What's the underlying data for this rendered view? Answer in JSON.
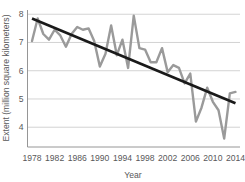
{
  "chart_data": {
    "type": "line",
    "title": "",
    "xlabel": "Year",
    "ylabel": "Extent (million square kilometers)",
    "xlim": [
      1977.2,
      2014.8
    ],
    "ylim": [
      3.3,
      8.15
    ],
    "xticks": [
      1978,
      1982,
      1986,
      1990,
      1994,
      1998,
      2002,
      2006,
      2010,
      2014
    ],
    "yticks": [
      4,
      5,
      6,
      7,
      8
    ],
    "grid": "horizontal",
    "legend": "none",
    "colors": {
      "data_line": "#9a9a9a",
      "trend_line": "#1a1a1a",
      "grid": "#c8c8c8",
      "axis": "#8a8a8a",
      "text": "#58585a",
      "background": "#ffffff"
    },
    "series": [
      {
        "name": "Sea ice extent",
        "color": "#9a9a9a",
        "x": [
          1978,
          1979,
          1980,
          1981,
          1982,
          1983,
          1984,
          1985,
          1986,
          1987,
          1988,
          1989,
          1990,
          1991,
          1992,
          1993,
          1994,
          1995,
          1996,
          1997,
          1998,
          1999,
          2000,
          2001,
          2002,
          2003,
          2004,
          2005,
          2006,
          2007,
          2008,
          2009,
          2010,
          2011,
          2012,
          2013,
          2014
        ],
        "values": [
          7.05,
          7.85,
          7.3,
          7.1,
          7.45,
          7.25,
          6.85,
          7.3,
          7.55,
          7.45,
          7.5,
          7.05,
          6.15,
          6.6,
          7.6,
          6.55,
          7.1,
          6.1,
          7.95,
          6.8,
          6.75,
          6.3,
          6.3,
          6.8,
          5.95,
          6.2,
          6.1,
          5.55,
          5.9,
          4.2,
          4.7,
          5.4,
          4.9,
          4.6,
          3.6,
          5.2,
          5.25
        ]
      },
      {
        "name": "Linear trend",
        "color": "#1a1a1a",
        "x": [
          1978,
          2014
        ],
        "values": [
          7.85,
          4.85
        ]
      }
    ]
  },
  "axis": {
    "ytick_labels": [
      "8",
      "7",
      "6",
      "5",
      "4"
    ],
    "xtick_labels": [
      "1978",
      "1982",
      "1986",
      "1990",
      "1994",
      "1998",
      "2002",
      "2006",
      "2010",
      "2014"
    ],
    "ylabel": "Extent (million square kilometers)",
    "xlabel": "Year"
  }
}
